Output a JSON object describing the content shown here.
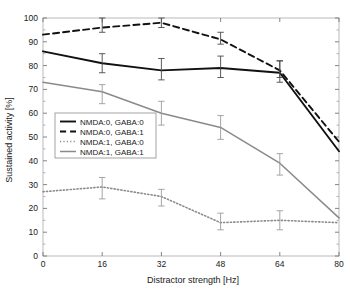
{
  "figure": {
    "clipped_top_text": "",
    "background": "#ffffff"
  },
  "chart_data": {
    "type": "line",
    "title": "",
    "xlabel": "Distractor strength [Hz]",
    "ylabel": "Sustained activity [%]",
    "x": [
      0,
      16,
      32,
      48,
      64,
      80
    ],
    "xticks": [
      "0",
      "16",
      "32",
      "48",
      "64",
      "80"
    ],
    "yticks": [
      "0",
      "10",
      "20",
      "30",
      "40",
      "50",
      "60",
      "70",
      "80",
      "90",
      "100"
    ],
    "xlim": [
      0,
      80
    ],
    "ylim": [
      0,
      100
    ],
    "grid": false,
    "legend_position": "center-left",
    "series": [
      {
        "name": "NMDA:0, GABA:0",
        "style": "solid",
        "color": "#111111",
        "width": 1.9,
        "values": [
          86,
          81,
          78,
          79,
          77,
          44
        ],
        "err_x": [
          16,
          32,
          48,
          64
        ],
        "err_lo": [
          77,
          74,
          75,
          73
        ],
        "err_hi": [
          85,
          83,
          84,
          82
        ]
      },
      {
        "name": "NMDA:0, GABA:1",
        "style": "dashed",
        "color": "#111111",
        "width": 1.9,
        "values": [
          93,
          96,
          98,
          91,
          78,
          48
        ],
        "err_x": [
          16,
          32,
          48,
          64
        ],
        "err_lo": [
          94,
          96,
          89,
          75
        ],
        "err_hi": [
          100,
          100,
          94,
          82
        ]
      },
      {
        "name": "NMDA:1, GABA:0",
        "style": "dotted",
        "color": "#8a8a8a",
        "width": 1.6,
        "values": [
          27,
          29,
          25,
          14,
          15,
          14
        ],
        "err_x": [
          16,
          32,
          48,
          64
        ],
        "err_lo": [
          24,
          21,
          11,
          11
        ],
        "err_hi": [
          33,
          28,
          18,
          19
        ]
      },
      {
        "name": "NMDA:1, GABA:1",
        "style": "solid",
        "color": "#8a8a8a",
        "width": 1.5,
        "values": [
          73,
          69,
          60,
          54,
          39,
          16
        ],
        "err_x": [
          16,
          32,
          48,
          64
        ],
        "err_lo": [
          64,
          55,
          49,
          34
        ],
        "err_hi": [
          72,
          65,
          59,
          43
        ]
      }
    ]
  }
}
